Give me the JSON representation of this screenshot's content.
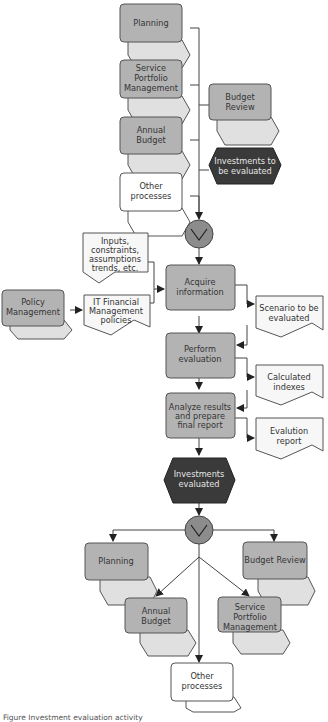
{
  "diagram": {
    "inputs_top": [
      {
        "id": "planning_in",
        "label": [
          "Planning"
        ],
        "type": "process-interface"
      },
      {
        "id": "spm_in",
        "label": [
          "Service",
          "Portfolio",
          "Management"
        ],
        "type": "process-interface"
      },
      {
        "id": "budget_review_in",
        "label": [
          "Budget",
          "Review"
        ],
        "type": "process-interface"
      },
      {
        "id": "annual_budget_in",
        "label": [
          "Annual",
          "Budget"
        ],
        "type": "process-interface"
      },
      {
        "id": "investments_to_eval",
        "label": [
          "Investments to",
          "be evaluated"
        ],
        "type": "event"
      },
      {
        "id": "other_in",
        "label": [
          "Other",
          "processes"
        ],
        "type": "process-interface-white"
      }
    ],
    "operator_top": {
      "symbol": "∨",
      "meaning": "OR"
    },
    "side_inputs": [
      {
        "id": "inputs_doc",
        "label": [
          "Inputs,",
          "constraints,",
          "assumptions",
          "trends, etc."
        ],
        "type": "document"
      },
      {
        "id": "policy_mgmt",
        "label": [
          "Policy",
          "Management"
        ],
        "type": "process-interface"
      },
      {
        "id": "itfm_policies",
        "label": [
          "IT Financial",
          "Management",
          "policies"
        ],
        "type": "document"
      }
    ],
    "functions": [
      {
        "id": "acquire",
        "label": [
          "Acquire",
          "information"
        ]
      },
      {
        "id": "perform",
        "label": [
          "Perform",
          "evaluation"
        ]
      },
      {
        "id": "analyze",
        "label": [
          "Analyze results",
          "and prepare",
          "final report"
        ]
      }
    ],
    "documents_out": [
      {
        "id": "scenario",
        "label": [
          "Scenario to be",
          "evaluated"
        ]
      },
      {
        "id": "indexes",
        "label": [
          "Calculated",
          "indexes"
        ]
      },
      {
        "id": "report",
        "label": [
          "Evalution",
          "report"
        ]
      }
    ],
    "event_out": {
      "label": [
        "Investments",
        "evaluated"
      ]
    },
    "operator_bottom": {
      "symbol": "∨",
      "meaning": "OR"
    },
    "outputs_bottom": [
      {
        "id": "planning_out",
        "label": [
          "Planning"
        ]
      },
      {
        "id": "budget_review_out",
        "label": [
          "Budget Review"
        ]
      },
      {
        "id": "annual_budget_out",
        "label": [
          "Annual",
          "Budget"
        ]
      },
      {
        "id": "spm_out",
        "label": [
          "Service",
          "Portfolio",
          "Management"
        ]
      },
      {
        "id": "other_out",
        "label": [
          "Other",
          "processes"
        ]
      }
    ],
    "caption": "Figure   Investment evaluation activity"
  },
  "colors": {
    "function_fill": "#b3b3b3",
    "shadow_fill": "#e0e0e0",
    "event_fill": "#3a3a3a",
    "operator_fill": "#8c8c8c",
    "document_fill": "#f7f7f7"
  }
}
